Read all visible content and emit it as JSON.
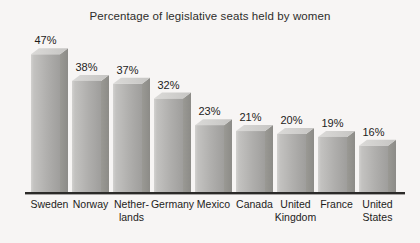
{
  "chart_data": {
    "type": "bar",
    "title": "Percentage of legislative seats held by women",
    "categories": [
      "Sweden",
      "Norway",
      "Netherlands",
      "Germany",
      "Mexico",
      "Canada",
      "United Kingdom",
      "France",
      "United States"
    ],
    "category_display": [
      [
        "Sweden"
      ],
      [
        "Norway"
      ],
      [
        "Nether-",
        "lands"
      ],
      [
        "Germany"
      ],
      [
        "Mexico"
      ],
      [
        "Canada"
      ],
      [
        "United",
        "Kingdom"
      ],
      [
        "France"
      ],
      [
        "United",
        "States"
      ]
    ],
    "values": [
      47,
      38,
      37,
      32,
      23,
      21,
      20,
      19,
      16
    ],
    "value_labels": [
      "47%",
      "38%",
      "37%",
      "32%",
      "23%",
      "21%",
      "20%",
      "19%",
      "16%"
    ],
    "xlabel": "",
    "ylabel": "",
    "ylim": [
      0,
      50
    ],
    "grid": false,
    "legend": "none",
    "bar_style": "3d-column",
    "colors": {
      "background": "#f7f5f4",
      "bar_front_light": "#d2d1cf",
      "bar_front_mid": "#b0afad",
      "bar_front_dark": "#9f9e9c",
      "bar_top_light": "#dbdad8",
      "bar_top_dark": "#c6c5c3",
      "bar_side_light": "#9a9994",
      "bar_side_dark": "#8c8b87",
      "axis_line": "#2b2a28",
      "text": "#1d1c1b",
      "title_text": "#2e2d2b"
    }
  }
}
